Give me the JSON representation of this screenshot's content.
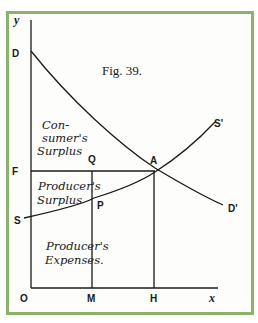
{
  "figure": {
    "title": "Fig. 39.",
    "axes": {
      "y_label": "y",
      "x_label": "x",
      "origin": "O"
    },
    "points": {
      "D": "D",
      "F": "F",
      "S": "S",
      "Q": "Q",
      "A": "A",
      "P": "P",
      "S_prime": "S'",
      "D_prime": "D'",
      "M": "M",
      "H": "H"
    },
    "regions": {
      "consumer_surplus": [
        "Con-",
        "sumer's",
        "Surplus"
      ],
      "producer_surplus": [
        "Producer's",
        "Surplus"
      ],
      "producer_expenses": [
        "Producer's",
        "Expenses."
      ]
    },
    "colors": {
      "border": "#8cb36a",
      "ink": "#1a1a1a"
    }
  }
}
